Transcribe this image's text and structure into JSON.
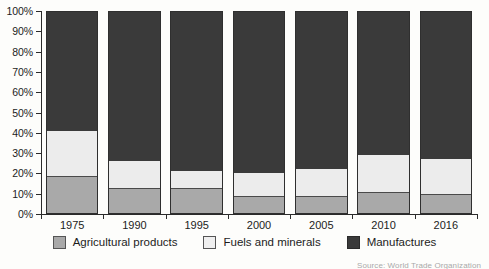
{
  "chart_data": {
    "type": "bar",
    "stacked": true,
    "normalized_percent": true,
    "title": "",
    "subtitle": "",
    "xlabel": "",
    "ylabel": "",
    "ylim": [
      0,
      100
    ],
    "grid": false,
    "legend_position": "bottom-center",
    "categories": [
      "1975",
      "1990",
      "1995",
      "2000",
      "2005",
      "2010",
      "2016"
    ],
    "ytick_labels": [
      "0%",
      "10%",
      "20%",
      "30%",
      "40%",
      "50%",
      "60%",
      "70%",
      "80%",
      "90%",
      "100%"
    ],
    "ytick_values": [
      0,
      10,
      20,
      30,
      40,
      50,
      60,
      70,
      80,
      90,
      100
    ],
    "series": [
      {
        "name": "Agricultural products",
        "color": "#a9a9a9",
        "values": [
          18,
          12,
          12,
          8,
          8,
          10,
          9
        ]
      },
      {
        "name": "Fuels and minerals",
        "color": "#ececec",
        "values": [
          23,
          14,
          9,
          12,
          14,
          19,
          18
        ]
      },
      {
        "name": "Manufactures",
        "color": "#3a3a3a",
        "values": [
          59,
          74,
          79,
          80,
          78,
          71,
          73
        ]
      }
    ],
    "annotations": []
  },
  "legend": {
    "items": [
      {
        "label": "Agricultural products",
        "swatch": "legend-swatch-agricultural"
      },
      {
        "label": "Fuels and minerals",
        "swatch": "legend-swatch-fuels"
      },
      {
        "label": "Manufactures",
        "swatch": "legend-swatch-manufactures"
      }
    ]
  },
  "source": {
    "text": "Source: World Trade Organization"
  }
}
